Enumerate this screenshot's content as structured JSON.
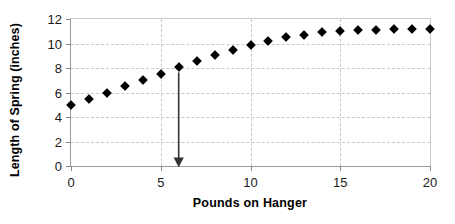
{
  "chart_data": {
    "type": "scatter",
    "title": "",
    "xlabel": "Pounds on Hanger",
    "ylabel": "Length of Spring (inches)",
    "xlim": [
      0,
      20
    ],
    "ylim": [
      0,
      12
    ],
    "xticks": [
      0,
      5,
      10,
      15,
      20
    ],
    "yticks": [
      0,
      2,
      4,
      6,
      8,
      10,
      12
    ],
    "xtick_labels": [
      "0",
      "5",
      "10",
      "15",
      "20"
    ],
    "ytick_labels": [
      "0",
      "2",
      "4",
      "6",
      "8",
      "10",
      "12"
    ],
    "grid": true,
    "grid_style": "dashed",
    "legend": false,
    "marker": "diamond",
    "marker_color": "#000000",
    "x": [
      0,
      1,
      2,
      3,
      4,
      5,
      6,
      7,
      8,
      9,
      10,
      11,
      12,
      13,
      14,
      15,
      16,
      17,
      18,
      19,
      20
    ],
    "values": [
      5.0,
      5.5,
      6.0,
      6.5,
      7.0,
      7.5,
      8.05,
      8.55,
      9.05,
      9.45,
      9.85,
      10.2,
      10.5,
      10.7,
      10.9,
      11.0,
      11.1,
      11.1,
      11.15,
      11.15,
      11.2
    ],
    "annotations": [
      {
        "name": "drop-arrow",
        "type": "arrow",
        "x": 6,
        "y_start": 8.05,
        "y_end": 0,
        "color": "#333333",
        "label": ""
      }
    ]
  },
  "axes": {
    "x_title": "Pounds on Hanger",
    "y_title": "Length of Spring (inches)"
  }
}
